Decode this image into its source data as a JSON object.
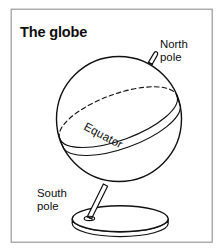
{
  "figure": {
    "title": "The globe",
    "type": "line-drawing-diagram",
    "background_color": "#ffffff",
    "ink_color": "#111111",
    "frame_color": "#9a9a9a"
  },
  "labels": {
    "north_pole_line1": "North",
    "north_pole_line2": "pole",
    "south_pole_line1": "South",
    "south_pole_line2": "pole",
    "equator": "Equator"
  },
  "parts": {
    "sphere_name": "globe-sphere",
    "equator_band_name": "equator-band",
    "axis_pin_name": "north-pole-axis-pin",
    "support_rod_name": "support-rod",
    "base_name": "globe-base-disc"
  },
  "geometry": {
    "sphere_center_x": 119,
    "sphere_center_y": 119,
    "sphere_radius": 63,
    "equator_tilt_deg": -20,
    "equator_label_rotation_deg": 28,
    "base_center_x": 120,
    "base_center_y": 219,
    "base_radius_x": 48,
    "base_radius_y": 13
  }
}
